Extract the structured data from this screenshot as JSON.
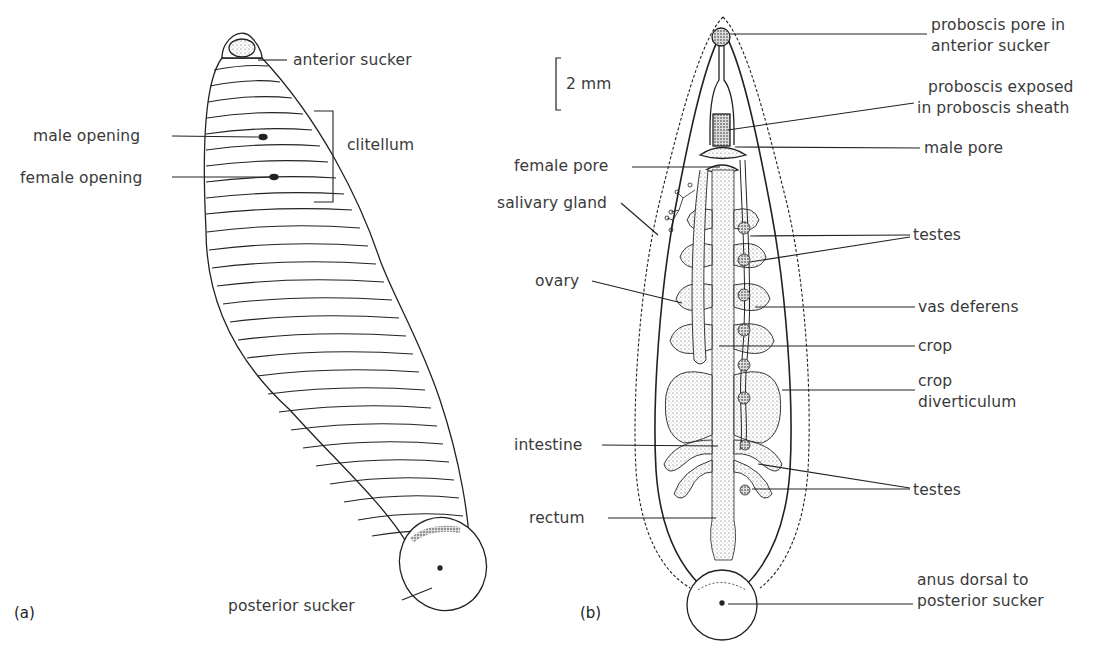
{
  "figure": {
    "panels": [
      {
        "id": "a",
        "tag": "(a)",
        "view": "external",
        "labels": {
          "anterior_sucker": "anterior sucker",
          "male_opening": "male opening",
          "female_opening": "female opening",
          "clitellum": "clitellum",
          "posterior_sucker": "posterior sucker"
        }
      },
      {
        "id": "b",
        "tag": "(b)",
        "view": "internal dissection",
        "scale_bar": "2 mm",
        "labels": {
          "proboscis_pore_1": "proboscis pore in",
          "proboscis_pore_2": "anterior sucker",
          "proboscis_exposed_1": "proboscis exposed",
          "proboscis_exposed_2": "in proboscis sheath",
          "male_pore": "male pore",
          "female_pore": "female pore",
          "salivary_gland": "salivary gland",
          "testes_upper": "testes",
          "ovary": "ovary",
          "vas_deferens": "vas deferens",
          "crop": "crop",
          "crop_diverticulum_1": "crop",
          "crop_diverticulum_2": "diverticulum",
          "intestine": "intestine",
          "testes_lower": "testes",
          "rectum": "rectum",
          "anus_1": "anus dorsal to",
          "anus_2": "posterior sucker"
        }
      }
    ]
  }
}
